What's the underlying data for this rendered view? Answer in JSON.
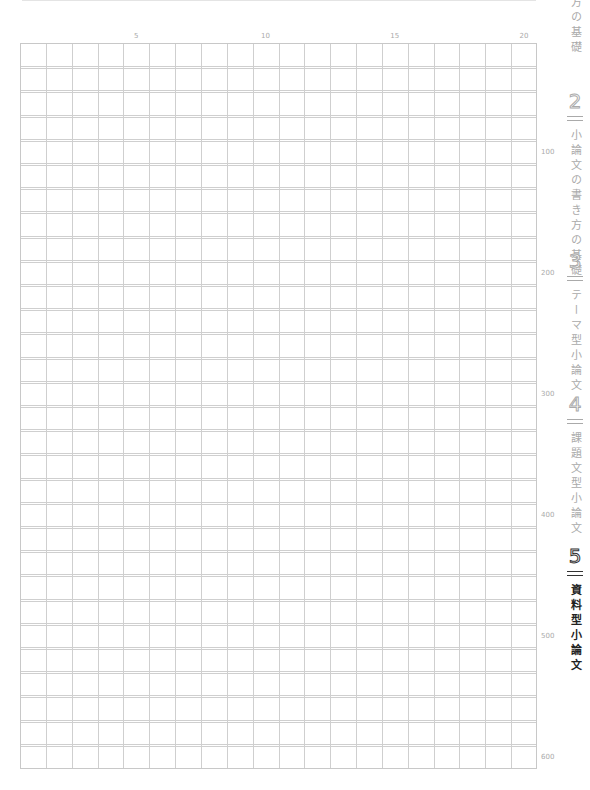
{
  "grid": {
    "columns": 20,
    "rows": 30,
    "total_characters": 600
  },
  "column_labels": [
    {
      "label": "5",
      "col": 5
    },
    {
      "label": "10",
      "col": 10
    },
    {
      "label": "15",
      "col": 15
    },
    {
      "label": "20",
      "col": 20
    }
  ],
  "row_labels": [
    {
      "label": "100",
      "row": 5
    },
    {
      "label": "200",
      "row": 10
    },
    {
      "label": "300",
      "row": 15
    },
    {
      "label": "400",
      "row": 20
    },
    {
      "label": "500",
      "row": 25
    },
    {
      "label": "600",
      "row": 30
    }
  ],
  "side_index": {
    "partial_top": "方の基礎",
    "chapters": [
      {
        "number": "2",
        "title": "小論文の書き方の基礎",
        "active": false
      },
      {
        "number": "3",
        "title": "テーマ型小論文",
        "active": false
      },
      {
        "number": "4",
        "title": "課題文型小論文",
        "active": false
      },
      {
        "number": "5",
        "title": "資料型小論文",
        "active": true
      }
    ]
  }
}
